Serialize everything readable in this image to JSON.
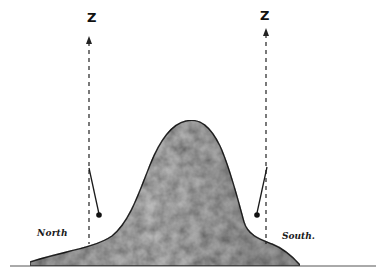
{
  "diagram": {
    "labels": {
      "zenith_left": "Z",
      "zenith_right": "Z",
      "north": "North",
      "south": "South."
    },
    "elements": {
      "mountain": {
        "fill": "#a9a9a9",
        "stroke": "#2a2a2a"
      },
      "ground_line": {
        "stroke": "#555555"
      },
      "zenith_lines": {
        "style": "dashed",
        "stroke": "#222222"
      },
      "plumb_lines": {
        "count": 2,
        "deflection": "toward mountain"
      }
    }
  }
}
